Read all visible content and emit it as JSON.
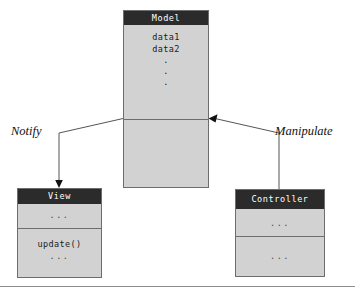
{
  "diagram": {
    "colors": {
      "header_fill": "#2b2b2b",
      "header_text": "#ffffff",
      "box_fill": "#d2d2d2",
      "box_border": "#6d6d6d",
      "connector": "#555555",
      "page_background": "#ffffff"
    },
    "classes": [
      {
        "name": "Model",
        "attributes": [
          "data1",
          "data2"
        ],
        "attribute_ellipsis": [
          ".",
          ".",
          "."
        ],
        "operations": []
      },
      {
        "name": "View",
        "attributes": [
          "..."
        ],
        "operations": [
          "update()",
          "..."
        ]
      },
      {
        "name": "Controller",
        "attributes": [
          "..."
        ],
        "operations": [
          "..."
        ]
      }
    ],
    "edges": [
      {
        "label": "Notify",
        "from": "Model",
        "to": "View",
        "arrow": "filled-arrowhead-down"
      },
      {
        "label": "Manipulate",
        "from": "Controller",
        "to": "Model",
        "arrow": "filled-arrowhead-left"
      }
    ]
  }
}
